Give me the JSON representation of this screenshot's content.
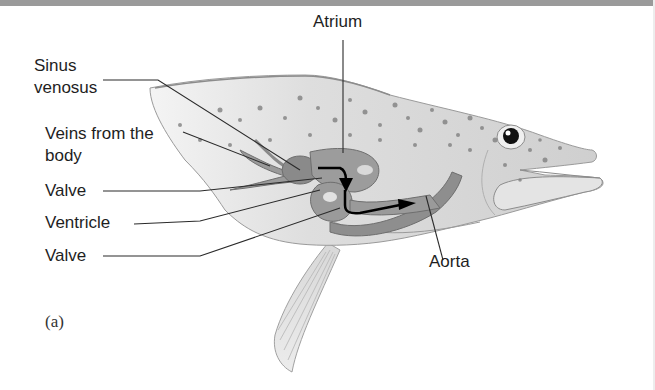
{
  "figure": {
    "panel_label": "(a)",
    "labels": {
      "atrium": "Atrium",
      "sinus_line1": "Sinus",
      "sinus_line2": "venosus",
      "veins_line1": "Veins from the",
      "veins_line2": "body",
      "valve_upper": "Valve",
      "ventricle": "Ventricle",
      "valve_lower": "Valve",
      "aorta": "Aorta"
    },
    "colors": {
      "body": "#d6d6d6",
      "heart": "#8a8a8a",
      "outline": "#8c8c8c",
      "text": "#1e1e1e",
      "arrow": "#000000"
    }
  }
}
